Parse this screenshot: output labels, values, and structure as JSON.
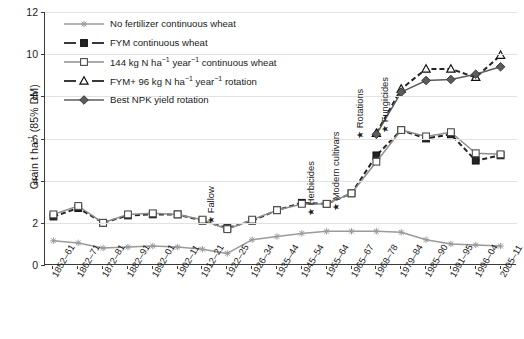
{
  "chart_data": {
    "type": "line",
    "title": "",
    "xlabel": "",
    "ylabel": "Grain t ha-1 (85% DM)",
    "ylabel_parts": {
      "prefix": "Grain t ha",
      "sup": "-1",
      "suffix": " (85% DM)"
    },
    "ylim": [
      0,
      12
    ],
    "yticks": [
      0,
      2,
      4,
      6,
      8,
      10,
      12
    ],
    "grid": true,
    "legend_position": "top-left inside",
    "categories": [
      "1852–61",
      "1862–71",
      "1872–81",
      "1882–91",
      "1892–01",
      "1902–11",
      "1912–21",
      "1922–25",
      "1926–34",
      "1935–44",
      "1945–54",
      "1955–64",
      "1965–67",
      "1968–78",
      "1979–84",
      "1985–90",
      "1991–95",
      "1996–04",
      "2005–11"
    ],
    "series": [
      {
        "name": "No fertilizer continuous wheat",
        "key": "no-fertilizer",
        "marker": "star",
        "color": "#9a9a9a",
        "dash": "solid",
        "values": [
          1.15,
          1.05,
          0.8,
          0.85,
          0.9,
          0.85,
          0.75,
          0.55,
          1.2,
          1.35,
          1.5,
          1.6,
          1.6,
          1.6,
          1.55,
          1.2,
          1.0,
          0.95,
          0.9
        ]
      },
      {
        "name": "FYM continuous wheat",
        "key": "fym-continuous",
        "marker": "filled-square",
        "color": "#232323",
        "dash": "dashed",
        "values": [
          2.3,
          2.7,
          2.0,
          2.35,
          2.4,
          2.4,
          2.1,
          1.75,
          2.1,
          2.6,
          2.95,
          2.9,
          3.4,
          5.2,
          6.4,
          6.0,
          6.2,
          4.95,
          5.2
        ]
      },
      {
        "name": "144 kg N ha-1 year-1 continuous wheat",
        "key": "n144-continuous",
        "marker": "open-square",
        "color": "#8e8e8e",
        "dash": "solid",
        "values": [
          2.4,
          2.8,
          2.0,
          2.4,
          2.45,
          2.4,
          2.15,
          1.7,
          2.15,
          2.6,
          2.9,
          2.9,
          3.4,
          4.9,
          6.4,
          6.1,
          6.3,
          5.3,
          5.25
        ]
      },
      {
        "name": "FYM+ 96 kg N ha-1 year-1 rotation",
        "key": "fym-plus-96n-rotation",
        "marker": "open-triangle",
        "color": "#232323",
        "dash": "dashed",
        "values": [
          null,
          null,
          null,
          null,
          null,
          null,
          null,
          null,
          null,
          null,
          null,
          null,
          null,
          6.25,
          8.35,
          9.3,
          9.3,
          8.9,
          9.95
        ]
      },
      {
        "name": "Best NPK yield rotation",
        "key": "best-npk-rotation",
        "marker": "filled-diamond",
        "color": "#5c5c5c",
        "dash": "solid",
        "values": [
          null,
          null,
          null,
          null,
          null,
          null,
          null,
          null,
          null,
          null,
          null,
          null,
          null,
          6.2,
          8.2,
          8.75,
          8.8,
          9.05,
          9.4
        ]
      }
    ],
    "annotations": [
      {
        "label": "Fallow",
        "category": "1922–25",
        "star": "★"
      },
      {
        "label": "Herbicides",
        "category": "1955–64",
        "star": "★"
      },
      {
        "label": "Modern cultivars",
        "category": "1965–67",
        "star": "★"
      },
      {
        "label": "Rotations",
        "category": "1968–78",
        "star": "★"
      },
      {
        "label": "Fungicides",
        "category": "1979–84",
        "star": "★"
      }
    ]
  }
}
